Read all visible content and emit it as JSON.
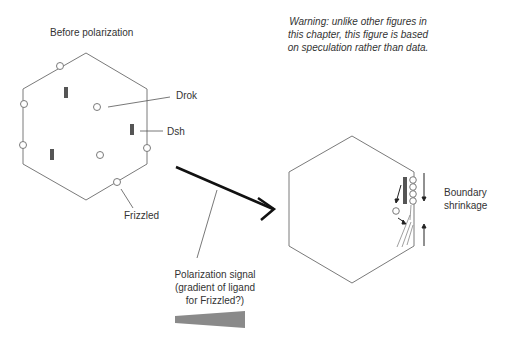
{
  "title": "Before polarization",
  "warning": {
    "lines": [
      "Warning: unlike other figures in",
      "this chapter, this figure is based",
      "on speculation rather than data."
    ]
  },
  "labels": {
    "drok": "Drok",
    "dsh": "Dsh",
    "frizzled": "Frizzled",
    "boundary_line1": "Boundary",
    "boundary_line2": "shrinkage",
    "signal_line1": "Polarization signal",
    "signal_line2": "(gradient of ligand",
    "signal_line3": "for Frizzled?)"
  },
  "colors": {
    "stroke": "#7a7a7a",
    "arrow": "#111111",
    "bar": "#555555",
    "gradient": "#8a8a8a",
    "text": "#333333"
  }
}
